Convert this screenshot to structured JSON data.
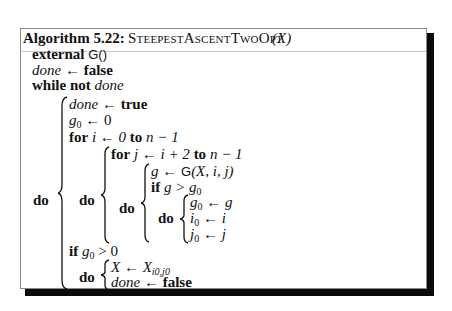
{
  "algorithm": {
    "label": "Algorithm 5.22:",
    "name": "SteepestAscentTwoOpt",
    "param": "(X)"
  },
  "code": {
    "external_kw": "external",
    "external_fn": "G()",
    "line_done_init": {
      "var": "done",
      "arrow": "←",
      "value": "false"
    },
    "while_kw": "while",
    "not_kw": "not",
    "while_cond": "done",
    "do_kw": "do",
    "outer_body": {
      "line_done_true": {
        "var": "done",
        "arrow": "←",
        "value": "true"
      },
      "line_g0_init": {
        "var": "g",
        "sub": "0",
        "arrow": "←",
        "value": "0"
      },
      "for_i": {
        "kw": "for",
        "expr": "i ← 0",
        "to_kw": "to",
        "limit": "n − 1"
      },
      "for_i_body": {
        "for_j": {
          "kw": "for",
          "expr": "j ← i + 2",
          "to_kw": "to",
          "limit": "n − 1"
        },
        "for_j_body": {
          "line_g": {
            "var": "g",
            "arrow": "←",
            "fn": "G",
            "args": "(X, i, j)"
          },
          "if_kw": "if",
          "if_cond_lhs": "g >",
          "if_cond_rhs": "g",
          "if_cond_sub": "0",
          "if_body": [
            {
              "var": "g",
              "sub": "0",
              "arrow": "←",
              "value": "g"
            },
            {
              "var": "i",
              "sub": "0",
              "arrow": "←",
              "value": "i"
            },
            {
              "var": "j",
              "sub": "0",
              "arrow": "←",
              "value": "j"
            }
          ]
        }
      },
      "if_g0": {
        "kw": "if",
        "var": "g",
        "sub": "0",
        "op": "> 0"
      },
      "if_g0_body": {
        "line_x": {
          "var": "X",
          "arrow": "←",
          "value": "X",
          "sub": "i0,j0"
        },
        "line_done_false": {
          "var": "done",
          "arrow": "←",
          "value": "false"
        }
      }
    }
  }
}
